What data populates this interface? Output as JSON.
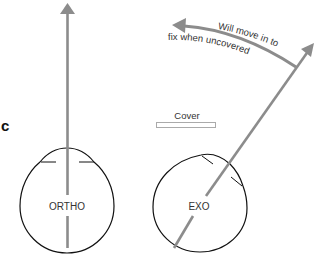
{
  "panel": {
    "letter": "c"
  },
  "labels": {
    "cover": "Cover",
    "ortho": "ORTHO",
    "exo": "EXO",
    "annotation_line1": "Will move in to",
    "annotation_line2": "fix when uncovered"
  },
  "colors": {
    "arrow": "#8c8c8c",
    "outline": "#111111",
    "text": "#333333",
    "cover_bar": "#aaaaaa"
  },
  "icons": {
    "ortho_arrow": "up-arrow-icon",
    "exo_arrow": "diagonal-arrow-icon",
    "move_arrow": "curved-left-arrow-icon"
  }
}
